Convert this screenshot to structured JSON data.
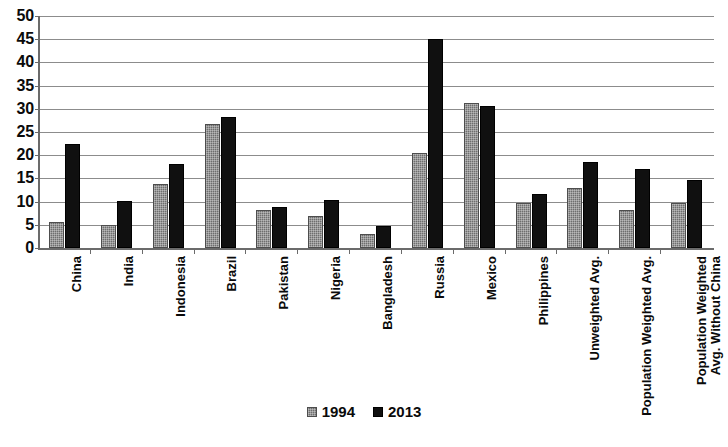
{
  "chart_data": {
    "type": "bar",
    "title": "",
    "xlabel": "",
    "ylabel": "",
    "ylim": [
      0,
      50
    ],
    "yticks": [
      0,
      5,
      10,
      15,
      20,
      25,
      30,
      35,
      40,
      45,
      50
    ],
    "grid": true,
    "legend_position": "bottom",
    "categories": [
      "China",
      "India",
      "Indonesia",
      "Brazil",
      "Pakistan",
      "Nigeria",
      "Bangladesh",
      "Russia",
      "Mexico",
      "Philippines",
      "Unweighted Avg.",
      "Population Weighted Avg.",
      "Population Weighted Avg. Without China"
    ],
    "series": [
      {
        "name": "1994",
        "color": "#6e6e6e",
        "values": [
          5.5,
          5.0,
          13.8,
          26.7,
          8.2,
          7.0,
          3.0,
          20.5,
          31.3,
          9.7,
          12.9,
          8.2,
          9.8
        ]
      },
      {
        "name": "2013",
        "color": "#101010",
        "values": [
          22.5,
          10.2,
          18.0,
          28.2,
          8.8,
          10.3,
          4.7,
          45.0,
          30.7,
          11.7,
          18.5,
          17.0,
          14.6
        ]
      }
    ]
  },
  "legend": {
    "items": [
      {
        "label": "1994",
        "swatch": "gray-square-icon"
      },
      {
        "label": "2013",
        "swatch": "black-square-icon"
      }
    ]
  }
}
